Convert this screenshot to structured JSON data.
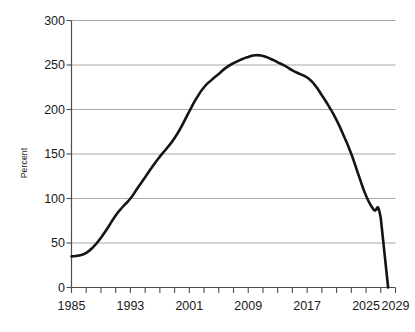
{
  "chart_data": {
    "type": "line",
    "title": "",
    "xlabel": "",
    "ylabel": "Percent",
    "xlim": [
      1985,
      2029
    ],
    "ylim": [
      0,
      300
    ],
    "grid": true,
    "grid_axis": "y",
    "legend": false,
    "line_color": "#141414",
    "grid_color": "#a8a8a8",
    "axis_color": "#4d4d4d",
    "ytick_labels": [
      "300",
      "250",
      "200",
      "150",
      "100",
      "50",
      "0"
    ],
    "ytick_values": [
      300,
      250,
      200,
      150,
      100,
      50,
      0
    ],
    "xtick_labels": [
      "1985",
      "1993",
      "2001",
      "2009",
      "2017",
      "2025",
      "2029"
    ],
    "xtick_values": [
      1985,
      1993,
      2001,
      2009,
      2017,
      2025,
      2029
    ],
    "minor_xticks_every": 2,
    "x": [
      1985,
      1986,
      1987,
      1988,
      1989,
      1990,
      1991,
      1992,
      1993,
      1994,
      1995,
      1996,
      1997,
      1998,
      1999,
      2000,
      2001,
      2002,
      2003,
      2004,
      2005,
      2006,
      2007,
      2008,
      2009,
      2010,
      2011,
      2012,
      2013,
      2014,
      2015,
      2016,
      2017,
      2018,
      2019,
      2020,
      2021,
      2022,
      2023,
      2024,
      2025,
      2026,
      2027,
      2028
    ],
    "values": [
      35,
      36,
      39,
      46,
      56,
      68,
      81,
      91,
      100,
      112,
      124,
      136,
      147,
      157,
      168,
      182,
      198,
      213,
      225,
      233,
      240,
      247,
      252,
      256,
      259,
      261,
      260,
      257,
      253,
      249,
      244,
      240,
      236,
      228,
      216,
      203,
      188,
      170,
      150,
      126,
      103,
      88,
      78,
      0
    ],
    "series_name": "Percent"
  }
}
